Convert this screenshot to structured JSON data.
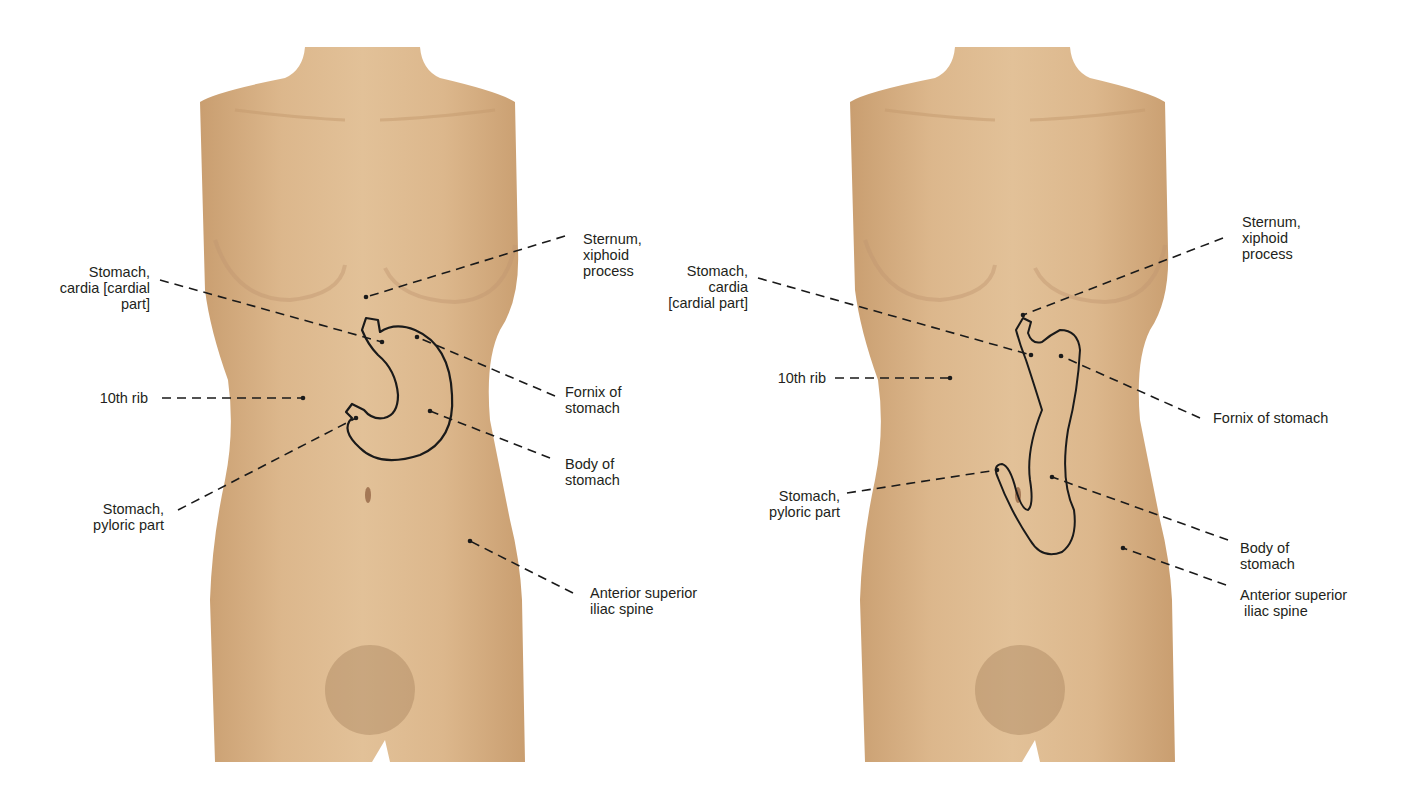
{
  "colors": {
    "skin": "#d9b48a",
    "skin_light": "#e6c7a0",
    "skin_shadow": "#c69a6c",
    "outline": "#1a1a1a",
    "text": "#231f20",
    "background": "#ffffff"
  },
  "figures": [
    {
      "id": "left",
      "description": "Anterior torso with stomach projection (J-shaped, typical position)",
      "labels": {
        "cardia": [
          "Stomach,",
          "cardia [cardial",
          "part]"
        ],
        "rib10": [
          "10th rib"
        ],
        "pyloric": [
          "Stomach,",
          "pyloric part"
        ],
        "sternum": [
          "Sternum,",
          "xiphoid",
          "process"
        ],
        "fornix": [
          "Fornix of",
          "stomach"
        ],
        "body": [
          "Body of",
          "stomach"
        ],
        "asis": [
          "Anterior superior",
          "iliac spine"
        ]
      }
    },
    {
      "id": "right",
      "description": "Anterior torso with stomach projection (elongated, low-lying stomach)",
      "labels": {
        "cardia": [
          "Stomach,",
          "cardia",
          "[cardial part]"
        ],
        "rib10": [
          "10th rib"
        ],
        "pyloric": [
          "Stomach,",
          "pyloric part"
        ],
        "sternum": [
          "Sternum,",
          "xiphoid",
          "process"
        ],
        "fornix": [
          "Fornix of stomach"
        ],
        "body": [
          "Body of",
          "stomach"
        ],
        "asis": [
          "Anterior superior",
          " iliac spine"
        ]
      }
    }
  ]
}
